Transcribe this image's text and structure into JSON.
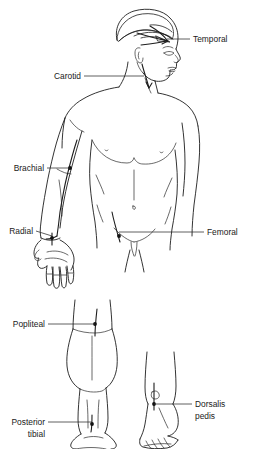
{
  "figure": {
    "background_color": "#ffffff",
    "line_color": "#1d1d1d",
    "text_color": "#1a1a1a"
  },
  "panels": [
    {
      "name": "upper-body-panel",
      "description": "Anterior view of male torso, head turned to the right, left arm and hand extended"
    },
    {
      "name": "lower-leg-panel",
      "description": "Posterior view of lower leg and heel"
    },
    {
      "name": "foot-panel",
      "description": "Lateral view of foot and ankle"
    }
  ],
  "labels": [
    {
      "id": "temporal",
      "text": "Temporal",
      "anchor": "right",
      "pulse_site": "temporal-artery",
      "panel": "upper-body-panel"
    },
    {
      "id": "carotid",
      "text": "Carotid",
      "anchor": "left",
      "pulse_site": "carotid-artery",
      "panel": "upper-body-panel"
    },
    {
      "id": "brachial",
      "text": "Brachial",
      "anchor": "left",
      "pulse_site": "brachial-artery",
      "panel": "upper-body-panel"
    },
    {
      "id": "radial",
      "text": "Radial",
      "anchor": "left",
      "pulse_site": "radial-artery",
      "panel": "upper-body-panel"
    },
    {
      "id": "femoral",
      "text": "Femoral",
      "anchor": "right",
      "pulse_site": "femoral-artery",
      "panel": "upper-body-panel"
    },
    {
      "id": "popliteal",
      "text": "Popliteal",
      "anchor": "left",
      "pulse_site": "popliteal-artery",
      "panel": "lower-leg-panel"
    },
    {
      "id": "posterior-tibial",
      "text_line1": "Posterior",
      "text_line2": "tibial",
      "anchor": "left",
      "pulse_site": "posterior-tibial-artery",
      "panel": "lower-leg-panel"
    },
    {
      "id": "dorsalis-pedis",
      "text_line1": "Dorsalis",
      "text_line2": "pedis",
      "anchor": "right",
      "pulse_site": "dorsalis-pedis-artery",
      "panel": "foot-panel"
    }
  ]
}
